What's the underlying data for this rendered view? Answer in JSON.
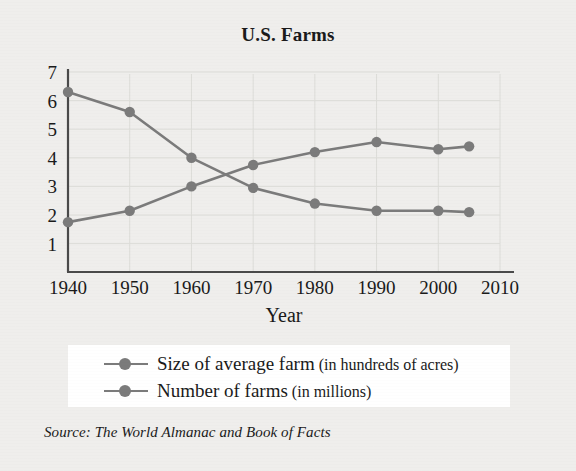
{
  "figure": {
    "title": "U.S. Farms",
    "source_prefix": "Source:",
    "source_text": "The World Almanac and Book of Facts",
    "background_color": "#efeeec",
    "series_color": "#7b7b7b",
    "axis_color": "#4a4a4a",
    "gridline_color": "#dcdcd8"
  },
  "legend": {
    "items": [
      {
        "label_main": "Size of average farm",
        "label_paren": "(in hundreds of acres)",
        "color": "#7b7b7b",
        "marker": "circle-line-marker"
      },
      {
        "label_main": "Number of farms",
        "label_paren": "(in millions)",
        "color": "#7b7b7b",
        "marker": "circle-line-marker"
      }
    ]
  },
  "chart_data": {
    "type": "line",
    "title": "U.S. Farms",
    "xlabel": "Year",
    "ylabel": "",
    "xlim": [
      1940,
      2010
    ],
    "ylim": [
      0,
      7
    ],
    "xticks": [
      1940,
      1950,
      1960,
      1970,
      1980,
      1990,
      2000,
      2010
    ],
    "yticks": [
      1,
      2,
      3,
      4,
      5,
      6,
      7
    ],
    "xtick_labels": [
      "1940",
      "1950",
      "1960",
      "1970",
      "1980",
      "1990",
      "2000",
      "2010"
    ],
    "ytick_labels": [
      "1",
      "2",
      "3",
      "4",
      "5",
      "6",
      "7"
    ],
    "grid": true,
    "legend_position": "below-axes",
    "x": [
      1940,
      1950,
      1960,
      1970,
      1980,
      1990,
      2000,
      2005
    ],
    "series": [
      {
        "name": "Size of average farm (in hundreds of acres)",
        "values": [
          1.75,
          2.15,
          3.0,
          3.75,
          4.2,
          4.55,
          4.3,
          4.4
        ],
        "color": "#7b7b7b",
        "marker": "o"
      },
      {
        "name": "Number of farms (in millions)",
        "values": [
          6.3,
          5.6,
          4.0,
          2.95,
          2.4,
          2.15,
          2.15,
          2.1
        ],
        "color": "#7b7b7b",
        "marker": "o"
      }
    ],
    "source": "The World Almanac and Book of Facts"
  },
  "geometry": {
    "plot_left": 68,
    "plot_right": 500,
    "plot_baseline": 272,
    "y_top_value": 7,
    "y_top_pixel": 72,
    "px_per_unit": 28.6,
    "px_per_decade": 61.7
  }
}
